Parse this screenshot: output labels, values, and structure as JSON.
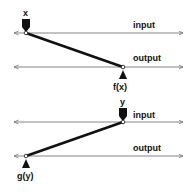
{
  "panels": [
    {
      "name": "forward",
      "input_label": "input",
      "output_label": "output",
      "input_marker_label": "x",
      "output_marker_label": "f(x)"
    },
    {
      "name": "inverse",
      "input_label": "input",
      "output_label": "output",
      "input_marker_label": "y",
      "output_marker_label": "g(y)"
    }
  ],
  "colors": {
    "line": "#111111",
    "axis": "#777777",
    "background": "#ffffff"
  }
}
